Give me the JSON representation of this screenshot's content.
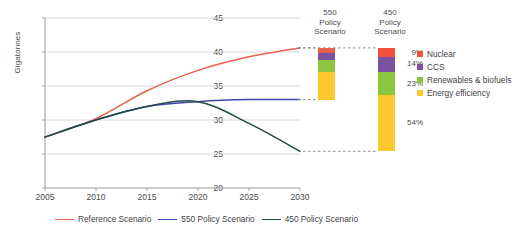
{
  "chart_data": {
    "type": "line",
    "title": "",
    "xlabel": "",
    "ylabel": "Gigatonnes",
    "xlim": [
      2005,
      2030
    ],
    "ylim": [
      20,
      45
    ],
    "yticks": [
      20,
      25,
      30,
      35,
      40,
      45
    ],
    "xticks": [
      2005,
      2010,
      2015,
      2020,
      2025,
      2030
    ],
    "grid": true,
    "legend_position": "bottom",
    "x": [
      2005,
      2010,
      2015,
      2020,
      2025,
      2030
    ],
    "series": [
      {
        "name": "Reference Scenario",
        "color": "#e8614a",
        "values": [
          27.5,
          30.2,
          34.3,
          37.3,
          39.3,
          40.6
        ],
        "end_value": 40.6
      },
      {
        "name": "550 Policy Scenario",
        "color": "#4147a8",
        "values": [
          27.5,
          30.0,
          32.0,
          32.7,
          33.0,
          33.0
        ],
        "end_value": 33.0
      },
      {
        "name": "450 Policy Scenario",
        "color": "#1f4d43",
        "values": [
          27.5,
          30.0,
          32.0,
          32.7,
          29.5,
          25.4
        ],
        "end_value": 25.4
      }
    ],
    "stacked_bars": [
      {
        "name": "550 Policy Scenario",
        "header_lines": [
          "550",
          "Policy",
          "Scenario"
        ],
        "top_value": 40.6,
        "bottom_value": 33.0,
        "segments": [
          {
            "label": "Nuclear",
            "color": "#e8614a",
            "share": 9,
            "pct_label": ""
          },
          {
            "label": "CCS",
            "color": "#7a52a1",
            "share": 14,
            "pct_label": ""
          },
          {
            "label": "Renewables & biofuels",
            "color": "#8cc63f",
            "share": 23,
            "pct_label": ""
          },
          {
            "label": "Energy efficiency",
            "color": "#fdc730",
            "share": 54,
            "pct_label": ""
          }
        ]
      },
      {
        "name": "450 Policy Scenario",
        "header_lines": [
          "450",
          "Policy",
          "Scenario"
        ],
        "top_value": 40.6,
        "bottom_value": 25.4,
        "segments": [
          {
            "label": "Nuclear",
            "color": "#f0503c",
            "share": 9,
            "pct_label": "9%"
          },
          {
            "label": "CCS",
            "color": "#7a52a1",
            "share": 14,
            "pct_label": "14%"
          },
          {
            "label": "Renewables & biofuels",
            "color": "#8cc63f",
            "share": 23,
            "pct_label": "23%"
          },
          {
            "label": "Energy efficiency",
            "color": "#fdc730",
            "share": 54,
            "pct_label": "54%"
          }
        ]
      }
    ],
    "category_legend": [
      {
        "label": "Nuclear",
        "color": "#f0503c"
      },
      {
        "label": "CCS",
        "color": "#7a52a1"
      },
      {
        "label": "Renewables & biofuels",
        "color": "#8cc63f"
      },
      {
        "label": "Energy efficiency",
        "color": "#fdc730"
      }
    ]
  },
  "axis": {
    "y_title": "Gigatonnes",
    "y_ticks": [
      "45",
      "40",
      "35",
      "30",
      "25",
      "20"
    ],
    "x_ticks": [
      "2005",
      "2010",
      "2015",
      "2020",
      "2025",
      "2030"
    ]
  },
  "bars": {
    "b550": {
      "line1": "550",
      "line2": "Policy",
      "line3": "Scenario"
    },
    "b450": {
      "line1": "450",
      "line2": "Policy",
      "line3": "Scenario",
      "pct_nuclear": "9%",
      "pct_ccs": "14%",
      "pct_renewables": "23%",
      "pct_efficiency": "54%"
    }
  },
  "right_legend": [
    {
      "label": "Nuclear"
    },
    {
      "label": "CCS"
    },
    {
      "label": "Renewables & biofuels"
    },
    {
      "label": "Energy efficiency"
    }
  ],
  "bottom_legend": [
    {
      "label": "Reference Scenario"
    },
    {
      "label": "550 Policy Scenario"
    },
    {
      "label": "450 Policy Scenario"
    }
  ],
  "colors": {
    "reference": "#e8614a",
    "policy550": "#4147a8",
    "policy450": "#1f4d43",
    "nuclear": "#f0503c",
    "ccs": "#7a52a1",
    "renewables": "#8cc63f",
    "efficiency": "#fdc730",
    "grid": "#d0d0d0",
    "axis": "#9a9a9a",
    "text": "#3f3f3f"
  }
}
